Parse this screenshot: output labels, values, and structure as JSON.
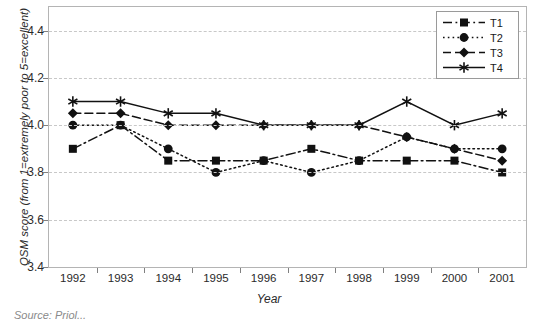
{
  "chart_data": {
    "type": "line",
    "title": "",
    "xlabel": "Year",
    "ylabel": "QSM score (from 1=extremely poor to 5=excellent)",
    "categories": [
      "1992",
      "1993",
      "1994",
      "1995",
      "1996",
      "1997",
      "1998",
      "1999",
      "2000",
      "2001"
    ],
    "x": [
      1992,
      1993,
      1994,
      1995,
      1996,
      1997,
      1998,
      1999,
      2000,
      2001
    ],
    "ylim": [
      3.4,
      4.5
    ],
    "yticks": [
      3.4,
      3.6,
      3.8,
      4.0,
      4.2,
      4.4
    ],
    "ytick_labels": [
      "3.4",
      "3.6",
      "3.8",
      "4.0",
      "4.2",
      "4.4"
    ],
    "grid": true,
    "legend_position": "top-right",
    "series": [
      {
        "name": "T1",
        "marker": "square",
        "linestyle": "dash-dot",
        "color": "#111111",
        "values": [
          3.9,
          4.0,
          3.85,
          3.85,
          3.85,
          3.9,
          3.85,
          3.85,
          3.85,
          3.8
        ]
      },
      {
        "name": "T2",
        "marker": "circle",
        "linestyle": "dotted",
        "color": "#111111",
        "values": [
          4.0,
          4.0,
          3.9,
          3.8,
          3.85,
          3.8,
          3.85,
          3.95,
          3.9,
          3.9
        ]
      },
      {
        "name": "T3",
        "marker": "diamond",
        "linestyle": "dashed",
        "color": "#111111",
        "values": [
          4.05,
          4.05,
          4.0,
          4.0,
          4.0,
          4.0,
          4.0,
          3.95,
          3.9,
          3.85
        ]
      },
      {
        "name": "T4",
        "marker": "asterisk",
        "linestyle": "solid",
        "color": "#111111",
        "values": [
          4.1,
          4.1,
          4.05,
          4.05,
          4.0,
          4.0,
          4.0,
          4.1,
          4.0,
          4.05
        ]
      }
    ]
  },
  "legend": {
    "entries": [
      {
        "label": "T1"
      },
      {
        "label": "T2"
      },
      {
        "label": "T3"
      },
      {
        "label": "T4"
      }
    ]
  },
  "footer": {
    "source_note": "Source: Priol..."
  }
}
